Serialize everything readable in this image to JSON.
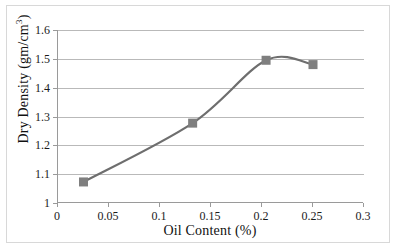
{
  "chart_data": {
    "type": "line",
    "title": "",
    "xlabel": "Oil Content (%)",
    "ylabel": "Dry Density (gm/cm³)",
    "ylabel_base": "Dry Density (gm/cm",
    "ylabel_sup": "3",
    "ylabel_tail": ")",
    "xlim": [
      0,
      0.3
    ],
    "ylim": [
      1,
      1.6
    ],
    "xticks": [
      "0",
      "0.05",
      "0.1",
      "0.15",
      "0.2",
      "0.25",
      "0.3"
    ],
    "xtick_values": [
      0,
      0.05,
      0.1,
      0.15,
      0.2,
      0.25,
      0.3
    ],
    "yticks": [
      "1",
      "1.1",
      "1.2",
      "1.3",
      "1.4",
      "1.5",
      "1.6"
    ],
    "ytick_values": [
      1,
      1.1,
      1.2,
      1.3,
      1.4,
      1.5,
      1.6
    ],
    "grid": "horizontal",
    "legend": "none",
    "series": [
      {
        "name": "Dry Density",
        "marker": "square",
        "marker_color": "#7f7f7f",
        "line_color": "#6e6e6e",
        "smooth": true,
        "x": [
          0.025,
          0.132,
          0.204,
          0.25
        ],
        "y": [
          1.073,
          1.277,
          1.495,
          1.48
        ]
      }
    ]
  },
  "colors": {
    "axis": "#9a9a9a",
    "grid": "#b9b9b9",
    "line": "#6e6e6e",
    "marker": "#7f7f7f",
    "text": "#111111",
    "figure_border": "#d8d8d8",
    "background": "#ffffff"
  }
}
